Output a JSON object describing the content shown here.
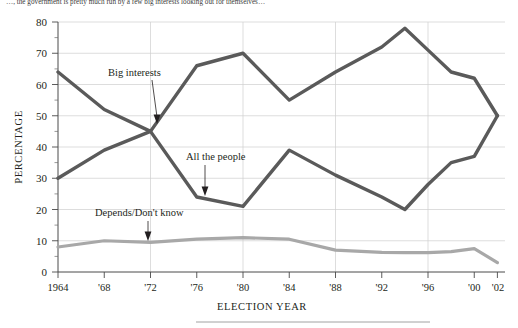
{
  "caption": {
    "top_text_partial": "…, the government is pretty much run by a few big interests looking out for themselves…"
  },
  "chart_data": {
    "type": "line",
    "title": "",
    "xlabel": "ELECTION YEAR",
    "ylabel": "PERCENTAGE",
    "ylim": [
      0,
      80
    ],
    "yticks": [
      0,
      10,
      20,
      30,
      40,
      50,
      60,
      70,
      80
    ],
    "ytick_labels": [
      "0",
      "10",
      "20",
      "30",
      "40",
      "50",
      "60",
      "70",
      "80"
    ],
    "xlim": [
      1964,
      2002
    ],
    "x": [
      1964,
      1968,
      1972,
      1976,
      1980,
      1984,
      1988,
      1992,
      1994,
      1996,
      1998,
      2000,
      2002
    ],
    "xticks": [
      1964,
      1968,
      1972,
      1976,
      1980,
      1984,
      1988,
      1992,
      1996,
      2000,
      2002
    ],
    "xtick_labels": [
      "1964",
      "'68",
      "'72",
      "'76",
      "'80",
      "'84",
      "'88",
      "'92",
      "'96",
      "'00",
      "'02"
    ],
    "grid": "vertical-and-horizontal-light",
    "legend": "inline-annotations",
    "series": [
      {
        "name": "Big interests",
        "color": "#5a5a5a",
        "values": [
          30,
          39,
          45,
          66,
          70,
          55,
          64,
          72,
          78,
          71,
          64,
          62,
          50
        ]
      },
      {
        "name": "All the people",
        "color": "#5a5a5a",
        "values": [
          64,
          52,
          45,
          24,
          21,
          39,
          31,
          24,
          20,
          28,
          35,
          37,
          50
        ]
      },
      {
        "name": "Depends/Don't know",
        "color": "#a8a8a8",
        "values": [
          8,
          10,
          9.5,
          10.5,
          11,
          10.5,
          7,
          6.3,
          6.2,
          6.2,
          6.5,
          7.5,
          3
        ]
      }
    ],
    "annotations": [
      {
        "label": "Big interests",
        "target_year": 1972,
        "target_value": 47
      },
      {
        "label": "All the people",
        "target_year": 1977,
        "target_value": 24
      },
      {
        "label": "Depends/Don't know",
        "target_year": 1972,
        "target_value": 12
      }
    ]
  }
}
